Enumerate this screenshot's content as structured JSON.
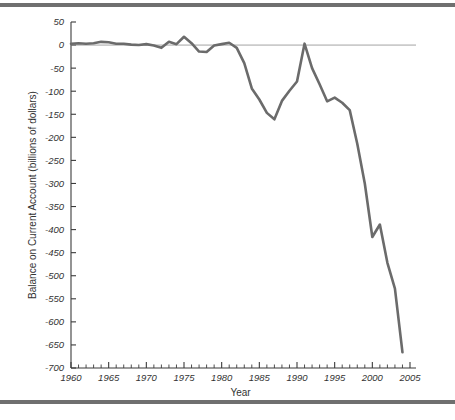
{
  "figure": {
    "background": "#ffffff",
    "rule_color": "#6f6f6f"
  },
  "chart_data": {
    "type": "line",
    "title": "",
    "xlabel": "Year",
    "ylabel": "Balance on Current Account (billions of dollars)",
    "xlim": [
      1960,
      2005
    ],
    "ylim": [
      -700,
      50
    ],
    "grid": false,
    "legend": "none",
    "line_color": "#6b6b6b",
    "zero_reference_line": true,
    "x_major_ticks": [
      1960,
      1965,
      1970,
      1975,
      1980,
      1985,
      1990,
      1995,
      2000,
      2005
    ],
    "x_tick_labels": [
      "1960",
      "1965",
      "1970",
      "1975",
      "1980",
      "1985",
      "1990",
      "1995",
      "2000",
      "2005"
    ],
    "x_minor_tick_step": 1,
    "y_major_ticks": [
      50,
      0,
      -50,
      -100,
      -150,
      -200,
      -250,
      -300,
      -350,
      -400,
      -450,
      -500,
      -550,
      -600,
      -650,
      -700
    ],
    "y_tick_labels": [
      "50",
      "0",
      "-50",
      "-100",
      "-150",
      "-200",
      "-250",
      "-300",
      "-350",
      "-400",
      "-450",
      "-500",
      "-550",
      "-600",
      "-650",
      "-700"
    ],
    "x": [
      1960,
      1961,
      1962,
      1963,
      1964,
      1965,
      1966,
      1967,
      1968,
      1969,
      1970,
      1971,
      1972,
      1973,
      1974,
      1975,
      1976,
      1977,
      1978,
      1979,
      1980,
      1981,
      1982,
      1983,
      1984,
      1985,
      1986,
      1987,
      1988,
      1989,
      1990,
      1991,
      1992,
      1993,
      1994,
      1995,
      1996,
      1997,
      1998,
      1999,
      2000,
      2001,
      2002,
      2003,
      2004
    ],
    "values": [
      3,
      4,
      3,
      4,
      7,
      6,
      3,
      3,
      1,
      0,
      2,
      -1,
      -6,
      7,
      2,
      18,
      4,
      -14,
      -15,
      -1,
      2,
      5,
      -6,
      -39,
      -94,
      -118,
      -147,
      -161,
      -121,
      -99,
      -79,
      3,
      -50,
      -85,
      -122,
      -114,
      -125,
      -141,
      -214,
      -300,
      -416,
      -389,
      -472,
      -528,
      -666
    ]
  }
}
